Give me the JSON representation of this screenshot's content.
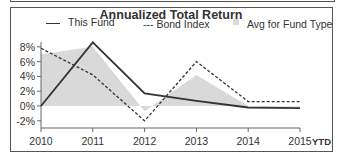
{
  "chart_data": {
    "type": "line",
    "title": "Annualized Total Return",
    "xlabel": "",
    "ylabel": "",
    "categories": [
      "2010",
      "2011",
      "2012",
      "2013",
      "2014",
      "2015"
    ],
    "x_suffix_label": "YTD",
    "y_ticks": [
      "8%",
      "6%",
      "4%",
      "2%",
      "0%",
      "-2%"
    ],
    "ylim": [
      -2,
      8
    ],
    "grid": false,
    "legend_position": "top",
    "series": [
      {
        "name": "This Fund",
        "style": "solid",
        "values": [
          0.0,
          8.6,
          1.7,
          0.7,
          -0.2,
          -0.3
        ]
      },
      {
        "name": "Bond Index",
        "style": "dashed",
        "values": [
          7.8,
          4.2,
          -2.0,
          6.0,
          0.6,
          0.6
        ]
      },
      {
        "name": "Avg for Fund Type",
        "style": "area",
        "values": [
          7.0,
          8.0,
          -0.7,
          4.2,
          0.0,
          -0.1
        ]
      }
    ]
  },
  "legend": {
    "this_fund": "This Fund",
    "bond_index": "--- Bond Index",
    "avg": "Avg for Fund Type"
  },
  "colors": {
    "line": "#333333",
    "area": "#d9d9d9",
    "frame": "#555555"
  }
}
